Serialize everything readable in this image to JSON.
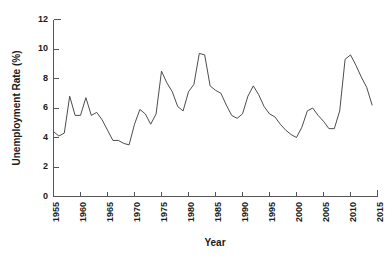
{
  "chart_data": {
    "type": "line",
    "title": "",
    "xlabel": "Year",
    "ylabel": "Unemployment Rate (%)",
    "xlim": [
      1955,
      2015
    ],
    "ylim": [
      0,
      12
    ],
    "xticks": [
      1955,
      1960,
      1965,
      1970,
      1975,
      1980,
      1985,
      1990,
      1995,
      2000,
      2005,
      2010,
      2015
    ],
    "yticks": [
      0,
      2,
      4,
      6,
      8,
      10,
      12
    ],
    "xtick_labels": [
      "1955",
      "1960",
      "1965",
      "1970",
      "1975",
      "1980",
      "1985",
      "1990",
      "1995",
      "2000",
      "2005",
      "2010",
      "2015"
    ],
    "ytick_labels": [
      "0",
      "2",
      "4",
      "6",
      "8",
      "10",
      "12"
    ],
    "grid": false,
    "legend": false,
    "legend_position": "none",
    "line_color": "#4d4d4d",
    "series": [
      {
        "name": "Unemployment Rate",
        "x": [
          1955,
          1956,
          1957,
          1958,
          1959,
          1960,
          1961,
          1962,
          1963,
          1964,
          1965,
          1966,
          1967,
          1968,
          1969,
          1970,
          1971,
          1972,
          1973,
          1974,
          1975,
          1976,
          1977,
          1978,
          1979,
          1980,
          1981,
          1982,
          1983,
          1984,
          1985,
          1986,
          1987,
          1988,
          1989,
          1990,
          1991,
          1992,
          1993,
          1994,
          1995,
          1996,
          1997,
          1998,
          1999,
          2000,
          2001,
          2002,
          2003,
          2004,
          2005,
          2006,
          2007,
          2008,
          2009,
          2010,
          2011,
          2012,
          2013,
          2014
        ],
        "values": [
          4.4,
          4.1,
          4.3,
          6.8,
          5.5,
          5.5,
          6.7,
          5.5,
          5.7,
          5.2,
          4.5,
          3.8,
          3.8,
          3.6,
          3.5,
          4.9,
          5.9,
          5.6,
          4.9,
          5.6,
          8.5,
          7.7,
          7.1,
          6.1,
          5.8,
          7.1,
          7.6,
          9.7,
          9.6,
          7.5,
          7.2,
          7.0,
          6.2,
          5.5,
          5.3,
          5.6,
          6.8,
          7.5,
          6.9,
          6.1,
          5.6,
          5.4,
          4.9,
          4.5,
          4.2,
          4.0,
          4.7,
          5.8,
          6.0,
          5.5,
          5.1,
          4.6,
          4.6,
          5.8,
          9.3,
          9.6,
          8.9,
          8.1,
          7.4,
          6.2
        ],
        "color": "#4d4d4d"
      }
    ],
    "annotations": []
  },
  "figure": {
    "background_color": "#ffffff",
    "axis_color": "#555555"
  }
}
